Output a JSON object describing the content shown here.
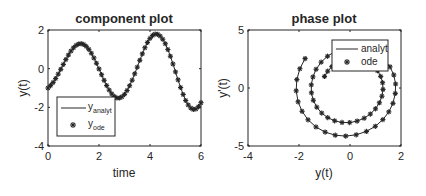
{
  "figure": {
    "background": "#ffffff",
    "ink": "#262626"
  },
  "chart_data": [
    {
      "type": "line",
      "title": "component plot",
      "xlabel": "time",
      "ylabel": "y(t)",
      "xlim": [
        0,
        6
      ],
      "ylim": [
        -4,
        2
      ],
      "xticks": [
        0,
        2,
        4,
        6
      ],
      "yticks": [
        -4,
        -2,
        0,
        2
      ],
      "grid": false,
      "legend": {
        "position": "southwest",
        "entries": [
          {
            "style": "line",
            "label": "y",
            "sub": "analyt"
          },
          {
            "style": "asterisk",
            "label": "y",
            "sub": "ode"
          }
        ]
      },
      "x": [
        0,
        0.1,
        0.2,
        0.3,
        0.4,
        0.5,
        0.6,
        0.7,
        0.8,
        0.9,
        1.0,
        1.1,
        1.2,
        1.3,
        1.4,
        1.5,
        1.6,
        1.7,
        1.8,
        1.9,
        2.0,
        2.1,
        2.2,
        2.3,
        2.4,
        2.5,
        2.6,
        2.7,
        2.8,
        2.9,
        3.0,
        3.1,
        3.2,
        3.3,
        3.4,
        3.5,
        3.6,
        3.7,
        3.8,
        3.9,
        4.0,
        4.1,
        4.2,
        4.3,
        4.4,
        4.5,
        4.6,
        4.7,
        4.8,
        4.9,
        5.0,
        5.1,
        5.2,
        5.3,
        5.4,
        5.5,
        5.6,
        5.7,
        5.8,
        5.9,
        6.0
      ],
      "series": [
        {
          "name": "y_analyt",
          "style": "line",
          "values": [
            -1.0,
            -0.875,
            -0.711,
            -0.51,
            -0.281,
            -0.035,
            0.219,
            0.47,
            0.702,
            0.909,
            1.079,
            1.204,
            1.277,
            1.294,
            1.253,
            1.153,
            1.0,
            0.798,
            0.555,
            0.279,
            -0.013,
            -0.312,
            -0.603,
            -0.873,
            -1.109,
            -1.302,
            -1.439,
            -1.512,
            -1.518,
            -1.454,
            -1.33,
            -1.131,
            -0.883,
            -0.597,
            -0.268,
            0.079,
            0.431,
            0.767,
            1.083,
            1.356,
            1.567,
            1.717,
            1.788,
            1.776,
            1.684,
            1.522,
            1.289,
            0.992,
            0.643,
            0.243,
            -0.167,
            -0.578,
            -0.975,
            -1.335,
            -1.647,
            -1.88,
            -2.036,
            -2.11,
            -2.085,
            -1.966,
            -1.76
          ]
        },
        {
          "name": "y_ode",
          "style": "asterisk",
          "values": [
            -1.0,
            -0.875,
            -0.711,
            -0.51,
            -0.281,
            -0.035,
            0.219,
            0.47,
            0.702,
            0.909,
            1.079,
            1.204,
            1.277,
            1.294,
            1.253,
            1.153,
            1.0,
            0.798,
            0.555,
            0.279,
            -0.013,
            -0.312,
            -0.603,
            -0.873,
            -1.109,
            -1.302,
            -1.439,
            -1.512,
            -1.518,
            -1.454,
            -1.33,
            -1.131,
            -0.883,
            -0.597,
            -0.268,
            0.079,
            0.431,
            0.767,
            1.083,
            1.356,
            1.567,
            1.717,
            1.788,
            1.776,
            1.684,
            1.522,
            1.289,
            0.992,
            0.643,
            0.243,
            -0.167,
            -0.578,
            -0.975,
            -1.335,
            -1.647,
            -1.88,
            -2.036,
            -2.11,
            -2.085,
            -1.966,
            -1.76
          ]
        }
      ]
    },
    {
      "type": "line",
      "title": "phase plot",
      "xlabel": "y(t)",
      "ylabel": "y'(t)",
      "xlim": [
        -4,
        2
      ],
      "ylim": [
        -5,
        5
      ],
      "xticks": [
        -4,
        -2,
        0,
        2
      ],
      "yticks": [
        -5,
        0,
        5
      ],
      "grid": false,
      "legend": {
        "position": "northeast",
        "entries": [
          {
            "style": "line",
            "label": "analyt"
          },
          {
            "style": "asterisk",
            "label": "ode"
          }
        ]
      },
      "series": [
        {
          "name": "analyt",
          "style": "line",
          "x": [
            -1.0,
            -0.875,
            -0.711,
            -0.51,
            -0.281,
            -0.035,
            0.219,
            0.47,
            0.702,
            0.909,
            1.079,
            1.204,
            1.277,
            1.294,
            1.253,
            1.153,
            1.0,
            0.798,
            0.555,
            0.279,
            -0.013,
            -0.312,
            -0.603,
            -0.873,
            -1.109,
            -1.302,
            -1.439,
            -1.512,
            -1.518,
            -1.454,
            -1.33,
            -1.131,
            -0.883,
            -0.597,
            -0.268,
            0.079,
            0.431,
            0.767,
            1.083,
            1.356,
            1.567,
            1.717,
            1.788,
            1.776,
            1.684,
            1.522,
            1.289,
            0.992,
            0.643,
            0.243,
            -0.167,
            -0.578,
            -0.975,
            -1.335,
            -1.647,
            -1.88,
            -2.036,
            -2.11,
            -2.085,
            -1.966,
            -1.76
          ],
          "y": [
            0.998,
            1.45,
            1.844,
            2.164,
            2.394,
            2.52,
            2.534,
            2.432,
            2.22,
            1.902,
            1.49,
            1.001,
            0.456,
            -0.122,
            -0.707,
            -1.273,
            -1.795,
            -2.244,
            -2.603,
            -2.853,
            -2.979,
            -2.971,
            -2.829,
            -2.555,
            -2.16,
            -1.651,
            -1.06,
            -0.415,
            0.269,
            0.954,
            1.615,
            2.23,
            2.738,
            3.128,
            3.397,
            3.516,
            3.478,
            3.284,
            2.93,
            2.429,
            1.824,
            1.123,
            0.345,
            -0.467,
            -1.326,
            -2.058,
            -2.727,
            -3.301,
            -3.744,
            -4.036,
            -4.145,
            -4.068,
            -3.801,
            -3.358,
            -2.74,
            -2.01,
            -1.189,
            -0.243,
            0.723,
            1.661,
            2.535
          ]
        },
        {
          "name": "ode",
          "style": "asterisk",
          "x": [
            -1.0,
            -0.875,
            -0.711,
            -0.51,
            -0.281,
            -0.035,
            0.219,
            0.47,
            0.702,
            0.909,
            1.079,
            1.204,
            1.277,
            1.294,
            1.253,
            1.153,
            1.0,
            0.798,
            0.555,
            0.279,
            -0.013,
            -0.312,
            -0.603,
            -0.873,
            -1.109,
            -1.302,
            -1.439,
            -1.512,
            -1.518,
            -1.454,
            -1.33,
            -1.131,
            -0.883,
            -0.597,
            -0.268,
            0.079,
            0.431,
            0.767,
            1.083,
            1.356,
            1.567,
            1.717,
            1.788,
            1.776,
            1.684,
            1.522,
            1.289,
            0.992,
            0.643,
            0.243,
            -0.167,
            -0.578,
            -0.975,
            -1.335,
            -1.647,
            -1.88,
            -2.036,
            -2.11,
            -2.085,
            -1.966,
            -1.76
          ],
          "y": [
            0.998,
            1.45,
            1.844,
            2.164,
            2.394,
            2.52,
            2.534,
            2.432,
            2.22,
            1.902,
            1.49,
            1.001,
            0.456,
            -0.122,
            -0.707,
            -1.273,
            -1.795,
            -2.244,
            -2.603,
            -2.853,
            -2.979,
            -2.971,
            -2.829,
            -2.555,
            -2.16,
            -1.651,
            -1.06,
            -0.415,
            0.269,
            0.954,
            1.615,
            2.23,
            2.738,
            3.128,
            3.397,
            3.516,
            3.478,
            3.284,
            2.93,
            2.429,
            1.824,
            1.123,
            0.345,
            -0.467,
            -1.326,
            -2.058,
            -2.727,
            -3.301,
            -3.744,
            -4.036,
            -4.145,
            -4.068,
            -3.801,
            -3.358,
            -2.74,
            -2.01,
            -1.189,
            -0.243,
            0.723,
            1.661,
            2.535
          ]
        }
      ]
    }
  ]
}
